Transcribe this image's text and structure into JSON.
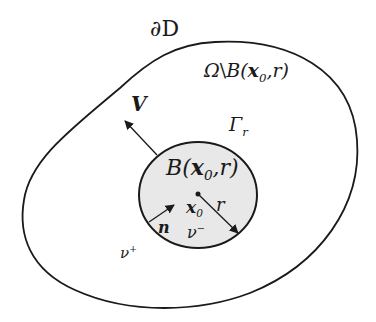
{
  "figure": {
    "colors": {
      "stroke": "#1a1a1a",
      "ball_fill": "#e8e8e8",
      "background": "#ffffff"
    },
    "labels": {
      "boundary": "∂D",
      "region_omega": "Ω",
      "region_sep": "\\",
      "region_B": "B(",
      "region_x": "x",
      "region_sub": "0",
      "region_rest": ",r)",
      "velocity": "V",
      "interface": "Γ",
      "interface_sub": "r",
      "ball_B": "B(",
      "ball_x": "x",
      "ball_sub": "0",
      "ball_rest": ",r)",
      "center_x": "x",
      "center_sub": "0",
      "radius": "r",
      "normal": "n",
      "nu_minus": "ν",
      "nu_minus_sup": "−",
      "nu_plus": "ν",
      "nu_plus_sup": "+"
    }
  }
}
